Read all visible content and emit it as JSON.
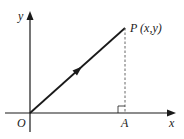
{
  "diagram": {
    "labels": {
      "y_axis": "y",
      "x_axis": "x",
      "origin": "O",
      "point_p": "P (x,y)",
      "point_a": "A"
    },
    "colors": {
      "line": "#1a1a1a",
      "dashed": "#555555",
      "background": "#ffffff"
    }
  }
}
